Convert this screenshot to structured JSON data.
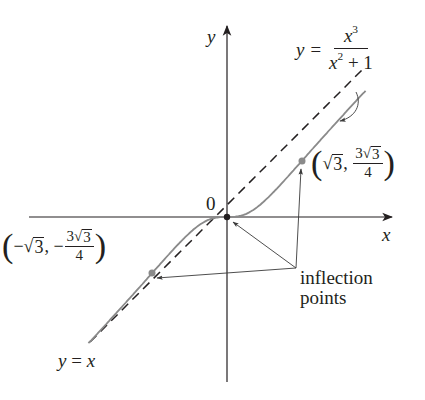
{
  "figure": {
    "type": "function-graph",
    "colors": {
      "axis": "#231f20",
      "curve": "#8a8a8a",
      "asymptote": "#231f20",
      "inflection_dot": "#8a8a8a",
      "origin_dot": "#231f20",
      "arrow": "#3a3a3a"
    }
  },
  "axes": {
    "x_label": "x",
    "y_label": "y",
    "origin_label": "0"
  },
  "curve": {
    "equation_lhs": "y =",
    "equation_num": "x",
    "equation_num_exp": "3",
    "equation_den_base": "x",
    "equation_den_exp": "2",
    "equation_den_tail": " + 1",
    "function": "x^3/(x^2+1)",
    "x_range": [
      -3.2,
      3.2
    ]
  },
  "asymptote": {
    "label": "y = x",
    "lhs": "y",
    "eq": " = ",
    "rhs": "x",
    "style": "dashed"
  },
  "inflection_points": {
    "annotation_line1": "inflection",
    "annotation_line2": "points",
    "positive": {
      "x": "√3",
      "x_value": 1.732,
      "y_num_coef": "3",
      "y_num_root": "3",
      "y_den": "4",
      "y_value": 1.299
    },
    "negative": {
      "x_sign": "−",
      "x": "√3",
      "x_value": -1.732,
      "y_sign": "−",
      "y_num_coef": "3",
      "y_num_root": "3",
      "y_den": "4",
      "y_value": -1.299
    },
    "origin": {
      "x": 0,
      "y": 0
    }
  }
}
